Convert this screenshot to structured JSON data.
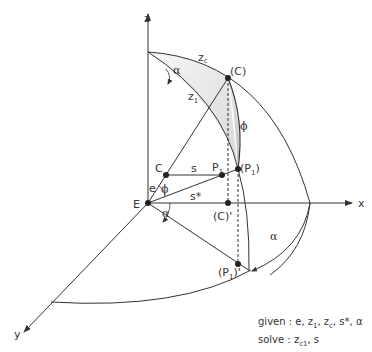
{
  "axes": {
    "z": "z",
    "x": "x",
    "y": "y"
  },
  "points": {
    "E": "E",
    "C": "C",
    "C_proj": "(C)",
    "C_shadow": "(C)'",
    "P1": "P",
    "P1_proj": "(P",
    "P1_shadow": "(P",
    "sub_1": "1",
    "close_paren": ")",
    "close_paren_prime": ")'"
  },
  "labels": {
    "z_c": "z",
    "z_c_sub": "c",
    "z_1": "z",
    "z_1_sub": "1",
    "s": "s",
    "s_star": "s*",
    "e": "e",
    "phi": "ϕ",
    "alpha": "α"
  },
  "notes": {
    "given_prefix": "given : e, z",
    "given_z1_sub": "1",
    "given_mid": ", z",
    "given_zc_sub": "c",
    "given_suffix": ", s*, α",
    "solve_prefix": "solve : z",
    "solve_sub": "c1",
    "solve_suffix": ", s"
  },
  "colors": {
    "line": "#333333",
    "shade_light": "#f2f2f2",
    "shade_dark": "#bbbbbb"
  }
}
